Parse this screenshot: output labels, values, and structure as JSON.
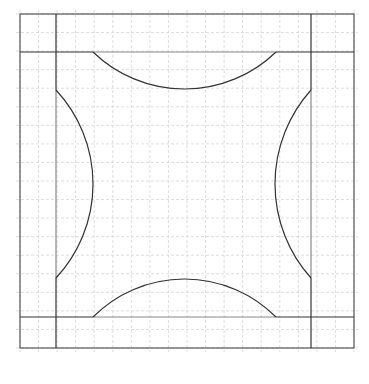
{
  "diagram": {
    "title": "",
    "colors": {
      "background": "#ffffff",
      "grid": "#d4d4d4",
      "stroke": "#333333",
      "outer_border": "#555555",
      "inner_segment": "#888888"
    },
    "outer_square": {
      "x": 20,
      "y": 14,
      "size": 334
    },
    "grid": {
      "cells": 18,
      "style": "dashed"
    },
    "inner_lines": {
      "left_x": 56,
      "right_x": 311,
      "top_y": 52,
      "bottom_y": 317
    },
    "arcs": [
      {
        "name": "top-arc",
        "from": [
          93,
          52
        ],
        "to": [
          276,
          52
        ],
        "apex": [
          185,
          89
        ]
      },
      {
        "name": "bottom-arc",
        "from": [
          93,
          317
        ],
        "to": [
          276,
          317
        ],
        "apex": [
          185,
          279
        ]
      },
      {
        "name": "left-arc",
        "from": [
          56,
          90
        ],
        "to": [
          56,
          278
        ],
        "apex": [
          93,
          184
        ]
      },
      {
        "name": "right-arc",
        "from": [
          311,
          90
        ],
        "to": [
          311,
          278
        ],
        "apex": [
          275,
          184
        ]
      }
    ]
  }
}
